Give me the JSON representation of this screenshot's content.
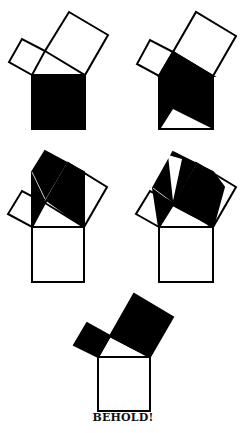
{
  "caption": "BEHOLD!",
  "colors": {
    "ink": "#000000",
    "paper": "#ffffff"
  },
  "figures": [
    {
      "id": 1,
      "description": "Square on hypotenuse shaded black; two leg squares outlined"
    },
    {
      "id": 2,
      "description": "Hypotenuse square dissected: shaded region with white triangle at bottom"
    },
    {
      "id": 3,
      "description": "Shaded parallelogram regions sheared over leg squares"
    },
    {
      "id": 4,
      "description": "Shaded regions further sheared to fill leg squares"
    },
    {
      "id": 5,
      "description": "Both leg squares shaded black, hypotenuse square outlined"
    }
  ]
}
